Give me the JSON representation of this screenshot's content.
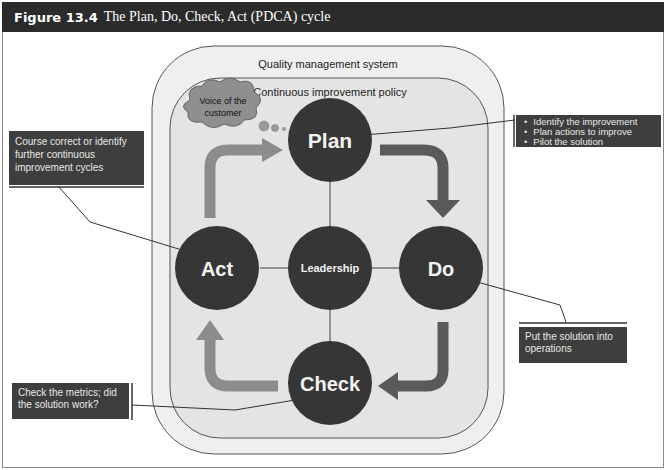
{
  "figure": {
    "number": "Figure 13.4",
    "title": "The Plan, Do, Check, Act (PDCA) cycle"
  },
  "containers": {
    "outer_label": "Quality management system",
    "inner_label": "Continuous improvement policy"
  },
  "thought_bubble": {
    "line1": "Voice of the",
    "line2": "customer"
  },
  "nodes": {
    "plan": "Plan",
    "do": "Do",
    "check": "Check",
    "act": "Act",
    "center": "Leadership"
  },
  "callouts": {
    "plan": {
      "items": [
        "Identify the improvement",
        "Plan actions to improve",
        "Pilot the solution"
      ]
    },
    "act": {
      "text": "Course correct or identify further continuous improvement cycles"
    },
    "do": {
      "text": "Put the solution into operations"
    },
    "check": {
      "text": "Check the metrics; did the solution work?"
    }
  },
  "colors": {
    "title_bar": "#2b2b2b",
    "node_fill": "#363636",
    "arrow_dark": "#5a5a5a",
    "arrow_light": "#8c8c8c",
    "outer_fill": "#efefef",
    "inner_fill": "#e3e3e3",
    "callout_fill": "#3e3e3e"
  }
}
